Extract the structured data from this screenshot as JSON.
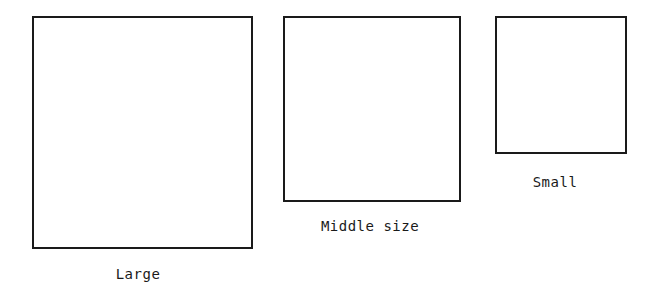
{
  "diagram": {
    "shapes": [
      {
        "id": "large",
        "label": "Large",
        "box": {
          "left": 32,
          "top": 16,
          "width": 221,
          "height": 233
        },
        "label_pos": {
          "x": 138,
          "y": 266
        }
      },
      {
        "id": "middle",
        "label": "Middle size",
        "box": {
          "left": 283,
          "top": 16,
          "width": 178,
          "height": 186
        },
        "label_pos": {
          "x": 370,
          "y": 218
        }
      },
      {
        "id": "small",
        "label": "Small",
        "box": {
          "left": 495,
          "top": 16,
          "width": 132,
          "height": 138
        },
        "label_pos": {
          "x": 555,
          "y": 174
        }
      }
    ],
    "colors": {
      "stroke": "#1a1a1a",
      "background": "#ffffff"
    }
  }
}
